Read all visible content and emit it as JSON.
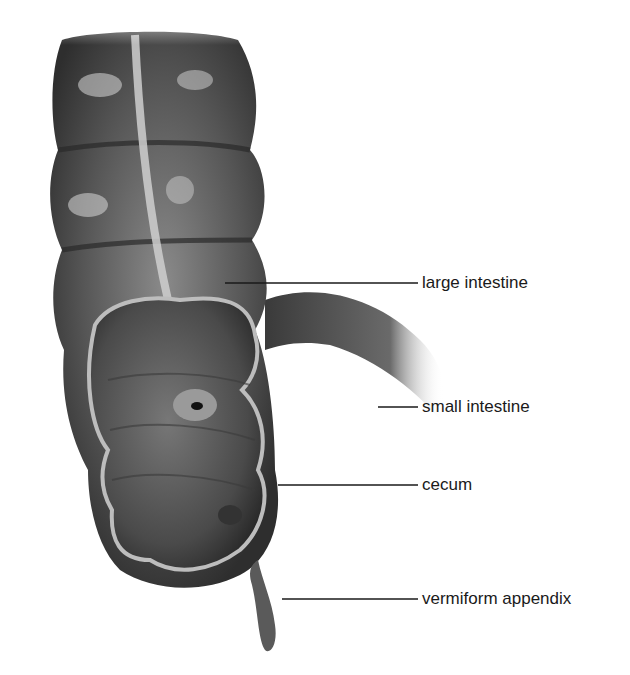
{
  "diagram": {
    "labels": [
      {
        "id": "large-intestine",
        "text": "large intestine",
        "x": 422,
        "y": 274,
        "line_from_x": 225,
        "line_y": 283
      },
      {
        "id": "small-intestine",
        "text": "small intestine",
        "x": 422,
        "y": 398,
        "line_from_x": 378,
        "line_y": 407
      },
      {
        "id": "cecum",
        "text": "cecum",
        "x": 422,
        "y": 476,
        "line_from_x": 278,
        "line_y": 485
      },
      {
        "id": "vermiform-appendix",
        "text": "vermiform appendix",
        "x": 422,
        "y": 590,
        "line_from_x": 282,
        "line_y": 599
      }
    ],
    "colors": {
      "background": "#ffffff",
      "tissue_dark": "#3a3a3a",
      "tissue_mid": "#6a6a6a",
      "tissue_light": "#a8a8a8",
      "highlight": "#e0e0e0",
      "line": "#1a1a1a",
      "text": "#1a1a1a"
    }
  }
}
